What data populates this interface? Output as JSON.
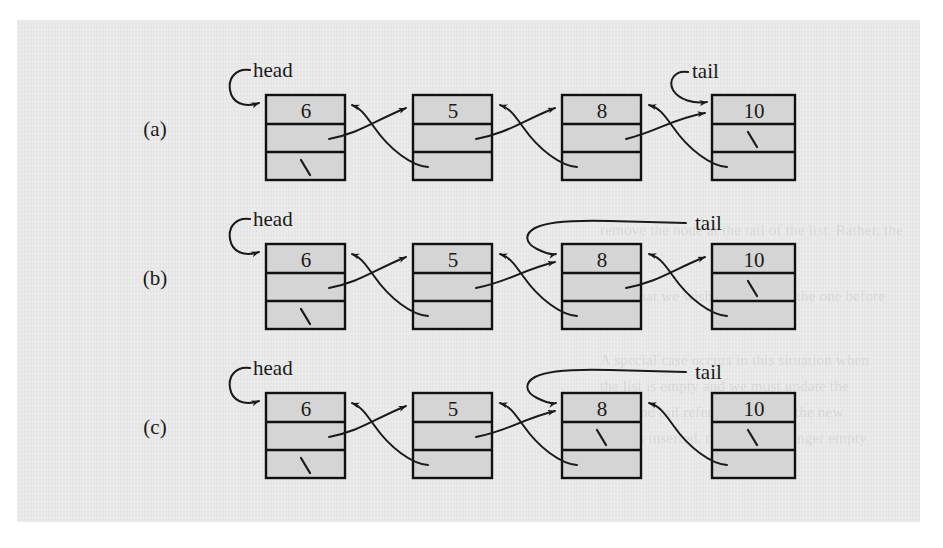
{
  "figure": {
    "caption_id": "doubly-linked-list-removal",
    "background_color": "#e9e9e9",
    "page_color": "#ffffff",
    "node_fill_color": "#d5d5d5",
    "ink_color": "#1a1a1a",
    "row_labels": [
      "(a)",
      "(b)",
      "(c)"
    ],
    "pointer_labels": {
      "head": "head",
      "tail": "tail"
    },
    "null_glyph": "\\",
    "rows": [
      {
        "id": "row-a",
        "label": "(a)",
        "head_label": "head",
        "tail_label": "tail",
        "head_target_node": 0,
        "tail_target_node": 3,
        "nodes": [
          {
            "value": "6",
            "prev": "null",
            "next": "5"
          },
          {
            "value": "5",
            "prev": "6",
            "next": "8"
          },
          {
            "value": "8",
            "prev": "5",
            "next": "10"
          },
          {
            "value": "10",
            "prev": "8",
            "next": "null"
          }
        ]
      },
      {
        "id": "row-b",
        "label": "(b)",
        "head_label": "head",
        "tail_label": "tail",
        "head_target_node": 0,
        "tail_target_node": 2,
        "nodes": [
          {
            "value": "6",
            "prev": "null",
            "next": "5"
          },
          {
            "value": "5",
            "prev": "6",
            "next": "8"
          },
          {
            "value": "8",
            "prev": "5",
            "next": "10"
          },
          {
            "value": "10",
            "prev": "8",
            "next": "null"
          }
        ]
      },
      {
        "id": "row-c",
        "label": "(c)",
        "head_label": "head",
        "tail_label": "tail",
        "head_target_node": 0,
        "tail_target_node": 2,
        "nodes": [
          {
            "value": "6",
            "prev": "null",
            "next": "5"
          },
          {
            "value": "5",
            "prev": "6",
            "next": "8"
          },
          {
            "value": "8",
            "prev": "5",
            "next": "null"
          },
          {
            "value": "10",
            "prev": "8",
            "next": "null"
          }
        ]
      }
    ],
    "ghost_text_lines": [
      "remove the node at the tail of the list. Rather, the",
      "node that we wish to remove is the one before",
      "A special case occurs in this situation when",
      "the list is empty and we must update the",
      "head and tail references. When the new",
      "node is inserted, the list is no longer empty"
    ]
  }
}
